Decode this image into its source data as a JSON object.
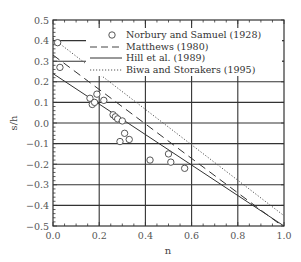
{
  "chart_data": {
    "type": "scatter",
    "title": "",
    "xlabel": "n",
    "ylabel": "s/h",
    "xlim": [
      0.0,
      1.0
    ],
    "ylim": [
      -0.5,
      0.5
    ],
    "xticks": [
      "0.0",
      "0.2",
      "0.4",
      "0.6",
      "0.8",
      "1.0"
    ],
    "yticks": [
      "0.5",
      "0.4",
      "0.3",
      "0.2",
      "0.1",
      "0.0",
      "-0.1",
      "-0.2",
      "-0.3",
      "-0.4",
      "-0.5"
    ],
    "grid": true,
    "legend_position": "upper right",
    "series": [
      {
        "name": "Norbury and Samuel (1928)",
        "style": "open-circle",
        "points": [
          [
            0.02,
            0.39
          ],
          [
            0.03,
            0.27
          ],
          [
            0.16,
            0.12
          ],
          [
            0.17,
            0.09
          ],
          [
            0.18,
            0.1
          ],
          [
            0.19,
            0.14
          ],
          [
            0.22,
            0.11
          ],
          [
            0.26,
            0.04
          ],
          [
            0.27,
            0.03
          ],
          [
            0.28,
            0.02
          ],
          [
            0.3,
            0.01
          ],
          [
            0.31,
            -0.05
          ],
          [
            0.29,
            -0.09
          ],
          [
            0.33,
            -0.08
          ],
          [
            0.42,
            -0.18
          ],
          [
            0.5,
            -0.15
          ],
          [
            0.51,
            -0.19
          ],
          [
            0.57,
            -0.22
          ]
        ]
      },
      {
        "name": "Matthews (1980)",
        "style": "dashed-line",
        "points": [
          [
            0.0,
            0.33
          ],
          [
            0.98,
            -0.49
          ]
        ]
      },
      {
        "name": "Hill et al. (1989)",
        "style": "solid-line",
        "points": [
          [
            0.0,
            0.24
          ],
          [
            1.0,
            -0.5
          ]
        ]
      },
      {
        "name": "Biwa and Storakers (1995)",
        "style": "dotted-line",
        "points": [
          [
            0.0,
            0.41
          ],
          [
            1.0,
            -0.45
          ]
        ]
      }
    ]
  },
  "legend": {
    "items": [
      {
        "label": "Norbury and Samuel (1928)"
      },
      {
        "label": "Matthews (1980)"
      },
      {
        "label": "Hill et al. (1989)"
      },
      {
        "label": "Biwa and Storakers (1995)"
      }
    ]
  },
  "axes": {
    "xlabel": "n",
    "ylabel": "s/h"
  }
}
